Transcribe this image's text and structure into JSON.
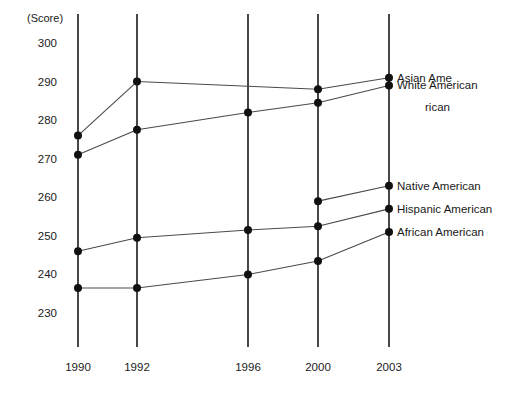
{
  "chart_data": {
    "type": "line",
    "title": "",
    "subtitle": "",
    "xlabel": "",
    "ylabel": "(Score)",
    "ylim": [
      230,
      300
    ],
    "xlim_categories": [
      "1990",
      "1992",
      "1996",
      "2000",
      "2003"
    ],
    "grid": false,
    "grid_style": "vertical-category-lines",
    "legend_position": "right-inline-at-last-point",
    "y_ticks": [
      300,
      290,
      280,
      270,
      260,
      250,
      240,
      230
    ],
    "x_ticks": [
      "1990",
      "1992",
      "1996",
      "2000",
      "2003"
    ],
    "categories": [
      "1990",
      "1992",
      "1996",
      "2000",
      "2003"
    ],
    "series": [
      {
        "name": "Asian Ame",
        "name_continuation": "rican",
        "full_name": "Asian American",
        "values": [
          276,
          290,
          null,
          288,
          291
        ],
        "color": "#4a4a4a"
      },
      {
        "name": "White American",
        "name_continuation": "",
        "full_name": "White American",
        "values": [
          271,
          277.5,
          282,
          284.5,
          289
        ],
        "color": "#4a4a4a"
      },
      {
        "name": "Native American",
        "name_continuation": "",
        "full_name": "Native American",
        "values": [
          null,
          null,
          null,
          259,
          263
        ],
        "color": "#4a4a4a"
      },
      {
        "name": "Hispanic American",
        "name_continuation": "",
        "full_name": "Hispanic American",
        "values": [
          246,
          249.5,
          251.5,
          252.5,
          257
        ],
        "color": "#4a4a4a"
      },
      {
        "name": "African American",
        "name_continuation": "",
        "full_name": "African American",
        "values": [
          236.5,
          236.5,
          240,
          243.5,
          251
        ],
        "color": "#4a4a4a"
      }
    ]
  },
  "axis": {
    "unit_label": "(Score)"
  }
}
